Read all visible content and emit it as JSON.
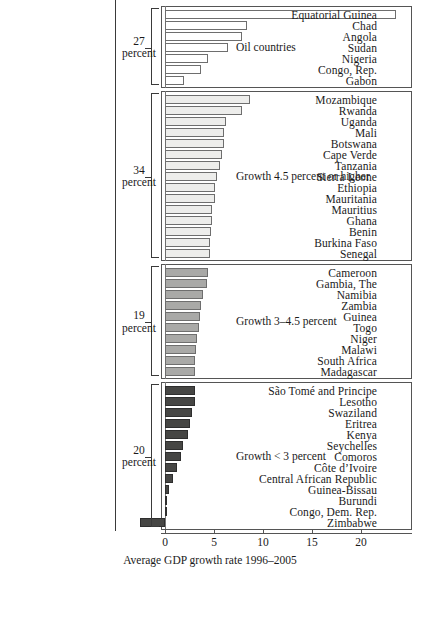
{
  "chart_data": {
    "type": "bar",
    "orientation": "horizontal",
    "title": "",
    "xlabel": "Average GDP growth rate 1996–2005",
    "ylabel": "",
    "xlim": [
      -3.2,
      25.2
    ],
    "xticks": [
      0,
      5,
      10,
      15,
      20
    ],
    "xticklabels": [
      "0",
      "5",
      "10",
      "15",
      "20"
    ],
    "grid": false,
    "legend": "none",
    "groups": [
      {
        "id": "oil",
        "caption": "Oil countries",
        "percent_value": "27",
        "percent_unit": "percent",
        "fill": "#ffffff",
        "categories": [
          "Equatorial Guinea",
          "Chad",
          "Angola",
          "Sudan",
          "Nigeria",
          "Congo, Rep.",
          "Gabon"
        ],
        "values": [
          23.6,
          8.4,
          7.9,
          6.4,
          4.4,
          3.7,
          1.9
        ]
      },
      {
        "id": "high-growth",
        "caption": "Growth 4.5 percent or higher",
        "percent_value": "34",
        "percent_unit": "percent",
        "fill": "#ededeb",
        "categories": [
          "Mozambique",
          "Rwanda",
          "Uganda",
          "Mali",
          "Botswana",
          "Cape Verde",
          "Tanzania",
          "Sierra Leone",
          "Ethiopia",
          "Mauritania",
          "Mauritius",
          "Ghana",
          "Benin",
          "Burkina Faso",
          "Senegal"
        ],
        "values": [
          8.7,
          7.9,
          6.2,
          6.0,
          6.0,
          5.8,
          5.6,
          5.3,
          5.1,
          5.1,
          4.8,
          4.8,
          4.7,
          4.6,
          4.6
        ]
      },
      {
        "id": "mid-growth",
        "caption": "Growth 3–4.5 percent",
        "percent_value": "19",
        "percent_unit": "percent",
        "fill": "#a9a9a7",
        "categories": [
          "Cameroon",
          "Gambia, The",
          "Namibia",
          "Zambia",
          "Guinea",
          "Togo",
          "Niger",
          "Malawi",
          "South Africa",
          "Madagascar"
        ],
        "values": [
          4.4,
          4.3,
          3.9,
          3.7,
          3.6,
          3.5,
          3.3,
          3.2,
          3.1,
          3.1
        ]
      },
      {
        "id": "low-growth",
        "caption": "Growth < 3 percent",
        "percent_value": "20",
        "percent_unit": "percent",
        "fill": "#464644",
        "categories": [
          "São Tomé and Principe",
          "Lesotho",
          "Swaziland",
          "Eritrea",
          "Kenya",
          "Seychelles",
          "Comoros",
          "Côte d’Ivoire",
          "Central African Republic",
          "Guinea-Bissau",
          "Burundi",
          "Congo, Dem. Rep.",
          "Zimbabwe"
        ],
        "values": [
          3.1,
          3.1,
          2.8,
          2.6,
          2.3,
          1.8,
          1.6,
          1.2,
          0.85,
          0.45,
          0.24,
          0.1,
          -2.6
        ]
      }
    ]
  }
}
